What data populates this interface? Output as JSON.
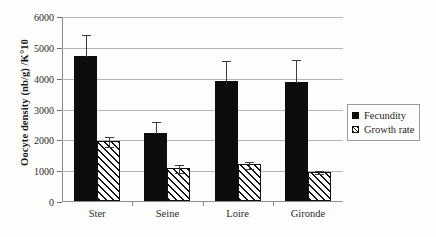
{
  "chart_data": {
    "type": "bar",
    "title": "",
    "xlabel": "",
    "ylabel": "Oocyte density (nb/g) /K°10",
    "categories": [
      "Ster",
      "Seine",
      "Loire",
      "Gironde"
    ],
    "ylim": [
      0,
      6000
    ],
    "ytick_labels": [
      "0",
      "1000",
      "2000",
      "3000",
      "4000",
      "5000",
      "6000"
    ],
    "ytick_values": [
      0,
      1000,
      2000,
      3000,
      4000,
      5000,
      6000
    ],
    "grid": true,
    "legend_position": "right",
    "series": [
      {
        "name": "Fecundity",
        "fill": "solid-black",
        "color": "#0d0d0d",
        "values": [
          4700,
          2200,
          3880,
          3870
        ],
        "error_upper": [
          720,
          390,
          680,
          740
        ],
        "error_lower": [
          0,
          0,
          0,
          0
        ]
      },
      {
        "name": "Growth rate",
        "fill": "diagonal-hatch",
        "color": "#111111",
        "values": [
          1950,
          1070,
          1190,
          950
        ],
        "error_upper": [
          160,
          130,
          110,
          40
        ],
        "error_lower": [
          150,
          130,
          110,
          40
        ]
      }
    ]
  },
  "legend": {
    "items": [
      {
        "label": "Fecundity",
        "swatch": "solid-square-icon"
      },
      {
        "label": "Growth rate",
        "swatch": "hatched-square-icon"
      }
    ]
  }
}
